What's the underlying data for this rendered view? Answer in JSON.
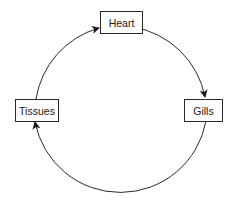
{
  "diagram": {
    "type": "cycle",
    "nodes": [
      {
        "id": "heart",
        "label": "Heart"
      },
      {
        "id": "gills",
        "label": "Gills"
      },
      {
        "id": "tissues",
        "label": "Tissues"
      }
    ],
    "edges": [
      {
        "from": "heart",
        "to": "gills"
      },
      {
        "from": "gills",
        "to": "tissues"
      },
      {
        "from": "tissues",
        "to": "heart"
      }
    ],
    "colors": {
      "line": "#2a2a2a",
      "background": "#ffffff"
    }
  }
}
